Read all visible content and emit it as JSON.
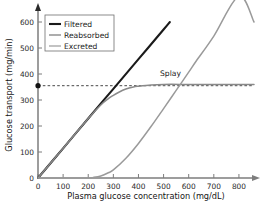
{
  "chart_data": {
    "type": "line",
    "title": "",
    "xlabel": "Plasma glucose concentration (mg/dL)",
    "ylabel": "Glucose transport (mg/min)",
    "xlim": [
      0,
      860
    ],
    "ylim": [
      0,
      650
    ],
    "xticks": [
      0,
      100,
      200,
      300,
      400,
      500,
      600,
      700,
      800
    ],
    "yticks": [
      0,
      100,
      200,
      300,
      400,
      500,
      600
    ],
    "grid": false,
    "legend_position": "top-left",
    "series": [
      {
        "name": "Filtered",
        "color": "#1a1a1a",
        "width": 2.1,
        "x": [
          0,
          100,
          200,
          300,
          400,
          500,
          525
        ],
        "values": [
          0,
          114,
          229,
          343,
          457,
          571,
          600
        ]
      },
      {
        "name": "Reabsorbed",
        "color": "#8a8a8a",
        "width": 1.5,
        "x": [
          0,
          100,
          200,
          250,
          280,
          300,
          320,
          350,
          380,
          400,
          450,
          500,
          600,
          700,
          800,
          860
        ],
        "values": [
          0,
          114,
          229,
          281,
          305,
          318,
          329,
          342,
          350,
          353,
          358,
          360,
          360,
          360,
          360,
          360
        ]
      },
      {
        "name": "Excreted",
        "color": "#9a9a9a",
        "width": 1.5,
        "x": [
          0,
          100,
          200,
          220,
          250,
          280,
          300,
          350,
          400,
          450,
          500,
          550,
          600,
          630,
          700,
          800,
          860
        ],
        "values": [
          0,
          0,
          0,
          2,
          8,
          20,
          31,
          76,
          133,
          198,
          267,
          337,
          407,
          450,
          546,
          700,
          600
        ]
      }
    ],
    "annotations": [
      {
        "text": "Splay",
        "x": 338,
        "y": 395
      }
    ],
    "markers": [
      {
        "name": "tm-marker",
        "x": 0,
        "y": 355,
        "color": "#111111"
      }
    ],
    "reference_lines": [
      {
        "name": "tm-dashed-line",
        "y": 355,
        "x_from": 0,
        "x_to": 860,
        "style": "dashed",
        "color": "#333333"
      }
    ]
  },
  "legend": {
    "entries": [
      {
        "label": "Filtered"
      },
      {
        "label": "Reabsorbed"
      },
      {
        "label": "Excreted"
      }
    ]
  },
  "axes": {
    "x": {
      "title": "Plasma glucose concentration (mg/dL)",
      "ticks": [
        "0",
        "100",
        "200",
        "300",
        "400",
        "500",
        "600",
        "700",
        "800"
      ]
    },
    "y": {
      "title": "Glucose transport (mg/min)",
      "ticks": [
        "0",
        "100",
        "200",
        "300",
        "400",
        "500",
        "600"
      ]
    }
  },
  "annotations": {
    "splay": "Splay"
  },
  "colors": {
    "filtered": "#1a1a1a",
    "reabsorbed": "#8a8a8a",
    "excreted": "#9a9a9a",
    "axis": "#7d7d7d",
    "background": "#ffffff"
  }
}
